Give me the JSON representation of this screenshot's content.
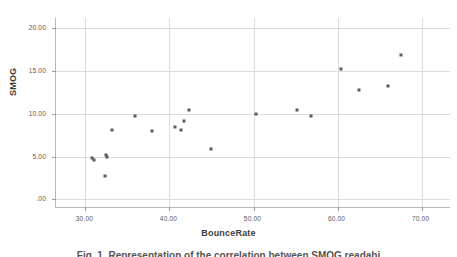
{
  "figure": {
    "caption": "Fig. 1. Representation of the correlation between SMOG readabi",
    "caption_clipped": true
  },
  "chart_data": {
    "type": "scatter",
    "title": "",
    "xlabel": "BounceRate",
    "ylabel": "SMOG",
    "xlim": [
      26.5,
      73.5
    ],
    "ylim": [
      -1.0,
      21.2
    ],
    "grid": true,
    "legend": null,
    "marker": {
      "shape": "square",
      "color": "#5a5a5a",
      "size_px": 3
    },
    "xticks": [
      30.0,
      40.0,
      50.0,
      60.0,
      70.0
    ],
    "xtick_labels": [
      "30.00",
      "40.00",
      "50.00",
      "60.00",
      "70.00"
    ],
    "yticks": [
      0.0,
      5.0,
      10.0,
      15.0,
      20.0
    ],
    "ytick_labels": [
      ".00",
      "5.00",
      "10.00",
      "15.00",
      "20.00"
    ],
    "series": [
      {
        "name": "SMOG vs BounceRate",
        "points": [
          {
            "x": 30.8,
            "y": 4.8
          },
          {
            "x": 31.0,
            "y": 4.6
          },
          {
            "x": 32.4,
            "y": 5.2
          },
          {
            "x": 32.6,
            "y": 5.0
          },
          {
            "x": 32.3,
            "y": 2.7
          },
          {
            "x": 33.2,
            "y": 8.1
          },
          {
            "x": 35.9,
            "y": 9.8
          },
          {
            "x": 37.9,
            "y": 8.0
          },
          {
            "x": 40.6,
            "y": 8.5
          },
          {
            "x": 41.4,
            "y": 8.1
          },
          {
            "x": 41.7,
            "y": 9.2
          },
          {
            "x": 42.3,
            "y": 10.5
          },
          {
            "x": 44.9,
            "y": 5.9
          },
          {
            "x": 50.3,
            "y": 10.0
          },
          {
            "x": 55.2,
            "y": 10.5
          },
          {
            "x": 56.8,
            "y": 9.8
          },
          {
            "x": 60.4,
            "y": 15.2
          },
          {
            "x": 62.6,
            "y": 12.8
          },
          {
            "x": 66.0,
            "y": 13.3
          },
          {
            "x": 67.6,
            "y": 16.9
          }
        ]
      }
    ]
  }
}
